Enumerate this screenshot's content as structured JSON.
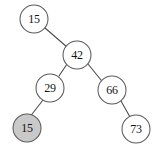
{
  "diagram": {
    "type": "binary-search-tree",
    "title": "",
    "canvas": {
      "width": 159,
      "height": 147
    },
    "style": {
      "background_color": "#ffffff",
      "node_stroke_color": "#5a5a5a",
      "node_fill_color": "#ffffff",
      "highlight_fill_color": "#c9c9c9",
      "edge_color": "#4d4d4d",
      "label_color": "#141414",
      "node_radius": 14
    },
    "nodes": [
      {
        "id": "n15top",
        "label": "15",
        "cx": 34,
        "cy": 19,
        "r": 14,
        "highlighted": false
      },
      {
        "id": "n42",
        "label": "42",
        "cx": 77,
        "cy": 55,
        "r": 14,
        "highlighted": false
      },
      {
        "id": "n29",
        "label": "29",
        "cx": 50,
        "cy": 88,
        "r": 14,
        "highlighted": false
      },
      {
        "id": "n66",
        "label": "66",
        "cx": 112,
        "cy": 90,
        "r": 14,
        "highlighted": false
      },
      {
        "id": "n15leaf",
        "label": "15",
        "cx": 27,
        "cy": 128,
        "r": 14,
        "highlighted": true
      },
      {
        "id": "n73",
        "label": "73",
        "cx": 136,
        "cy": 129,
        "r": 14,
        "highlighted": false
      }
    ],
    "edges": [
      {
        "id": "e-15top-42",
        "from": "n15top",
        "to": "n42",
        "x1": 45,
        "y1": 28,
        "x2": 67,
        "y2": 47
      },
      {
        "id": "e-42-29",
        "from": "n42",
        "to": "n29",
        "x1": 67,
        "y1": 64,
        "x2": 59,
        "y2": 76
      },
      {
        "id": "e-42-66",
        "from": "n42",
        "to": "n66",
        "x1": 88,
        "y1": 64,
        "x2": 101,
        "y2": 80
      },
      {
        "id": "e-29-15leaf",
        "from": "n29",
        "to": "n15leaf",
        "x1": 43,
        "y1": 100,
        "x2": 30,
        "y2": 117
      },
      {
        "id": "e-66-73",
        "from": "n66",
        "to": "n73",
        "x1": 121,
        "y1": 101,
        "x2": 130,
        "y2": 117
      }
    ]
  }
}
